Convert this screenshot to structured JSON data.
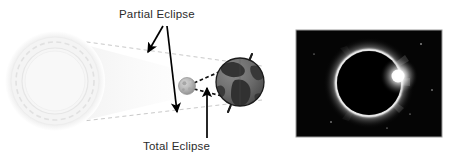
{
  "figure": {
    "background_color": "#ffffff"
  },
  "diagram": {
    "labels": {
      "partial": "Partial Eclipse",
      "total": "Total Eclipse"
    },
    "bodies": {
      "sun_name": "sun",
      "moon_name": "moon",
      "earth_name": "earth"
    },
    "colors": {
      "label_text": "#2b2b2b",
      "arrow": "#000000",
      "penumbra_line": "#c9c9c9",
      "umbra_line": "#111111",
      "sun_fill": "#f4f4f4",
      "sun_stroke": "#e3e3e3",
      "penumbra_fill": "#f7f7f7",
      "moon_fill": "#b8b8b8",
      "earth_ocean": "#6e6e6e",
      "earth_land": "#3a3a3a",
      "earth_outline": "#1d1d1d"
    }
  },
  "photo": {
    "caption_name": "total-solar-eclipse-photograph",
    "frame": {
      "x": 296,
      "y": 30,
      "width": 146,
      "height": 107
    },
    "colors": {
      "sky": "#050505",
      "corona": "#f2f2f2",
      "disk": "#000000",
      "border": "#9a9a9a"
    },
    "stars": [
      {
        "x": 0.86,
        "y": 0.13,
        "r": 0.7
      },
      {
        "x": 0.93,
        "y": 0.56,
        "r": 0.6
      },
      {
        "x": 0.24,
        "y": 0.86,
        "r": 0.6
      },
      {
        "x": 0.62,
        "y": 0.92,
        "r": 0.5
      },
      {
        "x": 0.12,
        "y": 0.22,
        "r": 0.5
      },
      {
        "x": 0.78,
        "y": 0.78,
        "r": 0.5
      }
    ]
  }
}
